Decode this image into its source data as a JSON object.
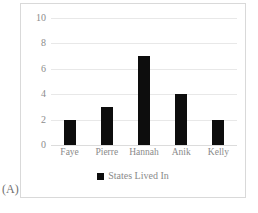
{
  "panel": {
    "caption": "(A)"
  },
  "colors": {
    "bar": "#0d0d0d",
    "gridline": "#e8e8e8",
    "frame_border": "#d9d9d9",
    "tick_text": "#8c8c8c",
    "background": "#ffffff"
  },
  "chart_data": {
    "type": "bar",
    "title": "",
    "subtitle": "",
    "xlabel": "",
    "ylabel": "",
    "categories": [
      "Faye",
      "Pierre",
      "Hannah",
      "Anik",
      "Kelly"
    ],
    "values": [
      2,
      3,
      7,
      4,
      2
    ],
    "series": [
      {
        "name": "States Lived In",
        "values": [
          2,
          3,
          7,
          4,
          2
        ],
        "color": "#0d0d0d"
      }
    ],
    "ylim": [
      0,
      10
    ],
    "yticks": [
      10,
      8,
      6,
      4,
      2,
      0
    ],
    "ytick_labels": [
      "10",
      "8",
      "6",
      "4",
      "2",
      "0"
    ],
    "grid": true,
    "grid_axis": "y",
    "legend": {
      "position": "bottom",
      "entries": [
        {
          "label": "States Lived In",
          "marker": "square",
          "color": "#0d0d0d"
        }
      ]
    },
    "annotations": [
      "(A)"
    ]
  }
}
